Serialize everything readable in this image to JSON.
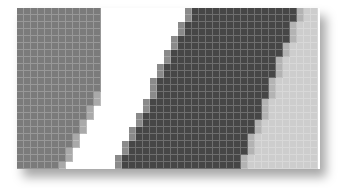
{
  "figure": {
    "cell_size_px": 7,
    "columns": 43,
    "rows": 23,
    "colors": {
      "mid_gray": "#7b7b7b",
      "dark_gray": "#464646",
      "light_gray": "#cdcdcd",
      "white": "#ffffff",
      "edge_mid": "#a9a9a9",
      "edge_dark": "#8a8a8a",
      "edge_light": "#b3b3b3"
    },
    "regions": {
      "left_block_right_edge_top_col": 12,
      "left_block_right_edge_bottom_col": 6,
      "dark_band_left_edge_top_col": 25,
      "dark_band_left_edge_bottom_col": 15,
      "dark_band_right_edge_top_col": 40,
      "dark_band_right_edge_bottom_col": 32
    }
  }
}
